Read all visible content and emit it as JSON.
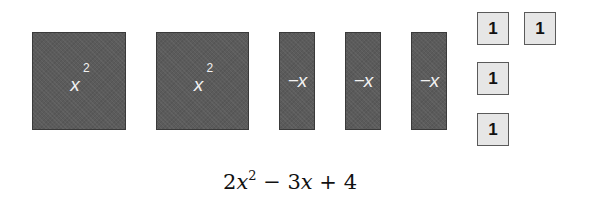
{
  "tiles": {
    "x_squared": [
      {
        "base": "x",
        "exp": "2"
      },
      {
        "base": "x",
        "exp": "2"
      }
    ],
    "neg_x": [
      {
        "label": "−x"
      },
      {
        "label": "−x"
      },
      {
        "label": "−x"
      }
    ],
    "units": [
      {
        "label": "1"
      },
      {
        "label": "1"
      },
      {
        "label": "1"
      },
      {
        "label": "1"
      }
    ]
  },
  "expression": {
    "coef1": "2",
    "var1": "x",
    "exp1": "2",
    "op1": " − ",
    "coef2": "3",
    "var2": "x",
    "op2": " + ",
    "const": "4"
  },
  "colors": {
    "dark_tile": "#5b5b5b",
    "unit_tile": "#e6e6e6"
  }
}
